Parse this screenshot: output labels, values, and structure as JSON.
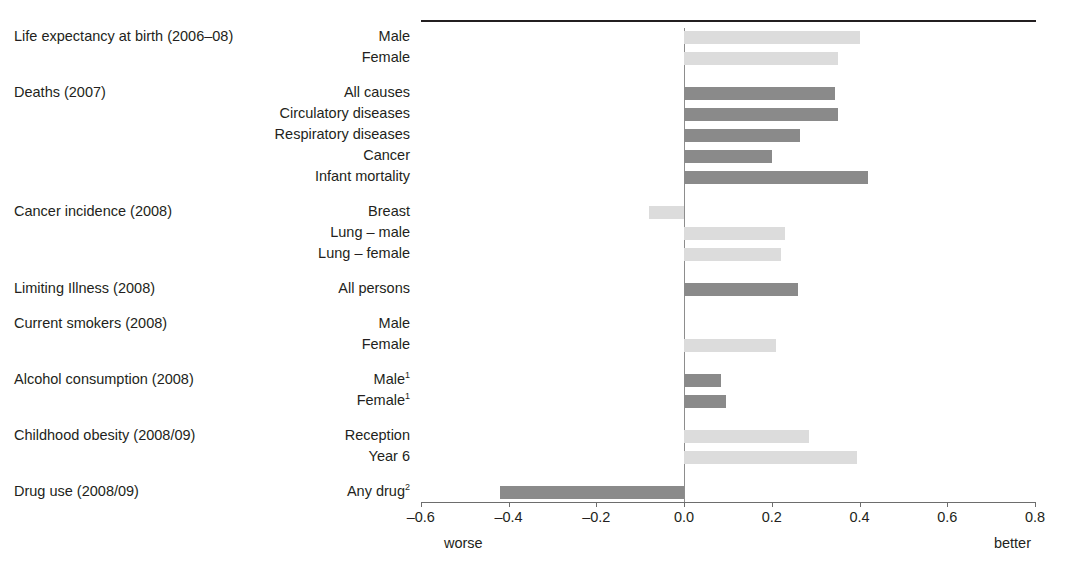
{
  "chart_data": {
    "type": "bar",
    "orientation": "horizontal",
    "title": "",
    "xlabel": "",
    "ylabel": "",
    "xlim": [
      -0.6,
      0.8
    ],
    "xticks": [
      "-0.6",
      "-0.4",
      "-0.2",
      "0.0",
      "0.2",
      "0.4",
      "0.6",
      "0.8"
    ],
    "xtick_values": [
      -0.6,
      -0.4,
      -0.2,
      0.0,
      0.2,
      0.4,
      0.6,
      0.8
    ],
    "grid": false,
    "legend": "none",
    "axis_notes": {
      "left": "worse",
      "right": "better"
    },
    "zero_reference_line": 0.0,
    "colors": {
      "light_bar": "#dcdcdc",
      "dark_bar": "#8a8a8a",
      "axis": "#6d6d6d",
      "text": "#231f20"
    },
    "groups": [
      {
        "group": "Life expectancy at birth (2006–08)",
        "items": [
          {
            "label": "Male",
            "value": 0.4,
            "shade": "light"
          },
          {
            "label": "Female",
            "value": 0.35,
            "shade": "light"
          }
        ]
      },
      {
        "group": "Deaths (2007)",
        "items": [
          {
            "label": "All causes",
            "value": 0.345,
            "shade": "dark"
          },
          {
            "label": "Circulatory diseases",
            "value": 0.35,
            "shade": "dark"
          },
          {
            "label": "Respiratory diseases",
            "value": 0.265,
            "shade": "dark"
          },
          {
            "label": "Cancer",
            "value": 0.2,
            "shade": "dark"
          },
          {
            "label": "Infant mortality",
            "value": 0.42,
            "shade": "dark"
          }
        ]
      },
      {
        "group": "Cancer incidence (2008)",
        "items": [
          {
            "label": "Breast",
            "value": -0.08,
            "shade": "light"
          },
          {
            "label": "Lung – male",
            "value": 0.23,
            "shade": "light"
          },
          {
            "label": "Lung – female",
            "value": 0.22,
            "shade": "light"
          }
        ]
      },
      {
        "group": "Limiting Illness (2008)",
        "items": [
          {
            "label": "All persons",
            "value": 0.26,
            "shade": "dark"
          }
        ]
      },
      {
        "group": "Current smokers (2008)",
        "items": [
          {
            "label": "Male",
            "value": 0.0,
            "shade": "light"
          },
          {
            "label": "Female",
            "value": 0.21,
            "shade": "light"
          }
        ]
      },
      {
        "group": "Alcohol consumption (2008)",
        "items": [
          {
            "label": "Male",
            "footnote": "1",
            "value": 0.085,
            "shade": "dark"
          },
          {
            "label": "Female",
            "footnote": "1",
            "value": 0.095,
            "shade": "dark"
          }
        ]
      },
      {
        "group": "Childhood obesity (2008/09)",
        "items": [
          {
            "label": "Reception",
            "value": 0.285,
            "shade": "light"
          },
          {
            "label": "Year 6",
            "value": 0.395,
            "shade": "light"
          }
        ]
      },
      {
        "group": "Drug use (2008/09)",
        "items": [
          {
            "label": "Any drug",
            "footnote": "2",
            "value": -0.42,
            "shade": "dark"
          }
        ]
      }
    ]
  }
}
